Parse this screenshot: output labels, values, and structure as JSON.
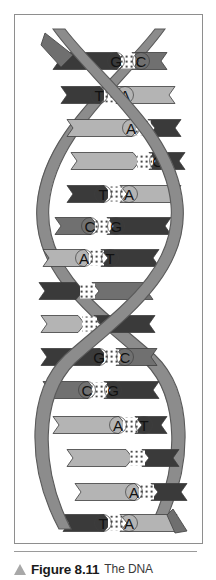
{
  "figure": {
    "panel_label": "dna-double-helix-diagram",
    "diagram_title": "DNA double helix with complementary base pairs",
    "colors": {
      "backbone": "#8c8c8c",
      "backbone_outline": "#5a5a5a",
      "base_dark": "#3a3a3a",
      "base_medium": "#707070",
      "base_light": "#b4b4b4",
      "panel_border": "#8e8e8e",
      "background": "#ffffff",
      "hydrogen_bond": "#ffffff",
      "caption_marker": "#a8a8a8"
    },
    "base_pairs": [
      {
        "id": "bp-1",
        "left": "G",
        "right": "C",
        "left_shade": "dark",
        "right_shade": "medium",
        "y": 46,
        "left_x": 38,
        "right_x": 152,
        "letter_left_x": 101,
        "letter_right_x": 126,
        "visible_left": true,
        "visible_right": true
      },
      {
        "id": "bp-2",
        "left": "T",
        "right": "A",
        "left_shade": "dark",
        "right_shade": "light",
        "y": 80,
        "left_x": 46,
        "right_x": 160,
        "letter_left_x": 84,
        "letter_right_x": 110,
        "visible_left": true,
        "visible_right": true
      },
      {
        "id": "bp-3",
        "left": "A",
        "right": "T",
        "left_shade": "light",
        "right_shade": "dark",
        "y": 113,
        "left_x": 52,
        "right_x": 166,
        "letter_left_x": 116,
        "letter_right_x": 142,
        "visible_left": true,
        "visible_right": false
      },
      {
        "id": "bp-4",
        "left": "C",
        "right": "G",
        "left_shade": "light",
        "right_shade": "dark",
        "y": 146,
        "left_x": 56,
        "right_x": 170,
        "letter_left_x": 117,
        "letter_right_x": 143,
        "visible_left": false,
        "visible_right": true
      },
      {
        "id": "bp-5",
        "left": "T",
        "right": "A",
        "left_shade": "dark",
        "right_shade": "light",
        "y": 179,
        "left_x": 52,
        "right_x": 166,
        "letter_left_x": 88,
        "letter_right_x": 114,
        "visible_left": true,
        "visible_right": true
      },
      {
        "id": "bp-6",
        "left": "C",
        "right": "G",
        "left_shade": "medium",
        "right_shade": "dark",
        "y": 211,
        "left_x": 40,
        "right_x": 156,
        "letter_left_x": 75,
        "letter_right_x": 101,
        "visible_left": true,
        "visible_right": true
      },
      {
        "id": "bp-7",
        "left": "A",
        "right": "T",
        "left_shade": "light",
        "right_shade": "dark",
        "y": 243,
        "left_x": 28,
        "right_x": 144,
        "letter_left_x": 69,
        "letter_right_x": 95,
        "visible_left": true,
        "visible_right": true
      },
      {
        "id": "bp-8",
        "left": "G",
        "right": "C",
        "left_shade": "dark",
        "right_shade": "medium",
        "y": 276,
        "left_x": 24,
        "right_x": 138,
        "letter_left_x": 60,
        "letter_right_x": 86,
        "visible_left": false,
        "visible_right": false
      },
      {
        "id": "bp-9",
        "left": "T",
        "right": "A",
        "left_shade": "light",
        "right_shade": "dark",
        "y": 309,
        "left_x": 26,
        "right_x": 140,
        "letter_left_x": 62,
        "letter_right_x": 88,
        "visible_left": false,
        "visible_right": false
      },
      {
        "id": "bp-10",
        "left": "G",
        "right": "C",
        "left_shade": "dark",
        "right_shade": "medium",
        "y": 342,
        "left_x": 26,
        "right_x": 142,
        "letter_left_x": 84,
        "letter_right_x": 110,
        "visible_left": true,
        "visible_right": true
      },
      {
        "id": "bp-11",
        "left": "C",
        "right": "G",
        "left_shade": "medium",
        "right_shade": "dark",
        "y": 375,
        "left_x": 28,
        "right_x": 144,
        "letter_left_x": 72,
        "letter_right_x": 98,
        "visible_left": true,
        "visible_right": true
      },
      {
        "id": "bp-12",
        "left": "A",
        "right": "T",
        "left_shade": "light",
        "right_shade": "dark",
        "y": 410,
        "left_x": 38,
        "right_x": 152,
        "letter_left_x": 103,
        "letter_right_x": 129,
        "visible_left": true,
        "visible_right": true
      },
      {
        "id": "bp-13",
        "left": "G",
        "right": "C",
        "left_shade": "light",
        "right_shade": "dark",
        "y": 443,
        "left_x": 52,
        "right_x": 164,
        "letter_left_x": 110,
        "letter_right_x": 136,
        "visible_left": false,
        "visible_right": false
      },
      {
        "id": "bp-14",
        "left": "A",
        "right": "T",
        "left_shade": "light",
        "right_shade": "dark",
        "y": 477,
        "left_x": 60,
        "right_x": 172,
        "letter_left_x": 119,
        "letter_right_x": 145,
        "visible_left": true,
        "visible_right": false
      },
      {
        "id": "bp-15",
        "left": "T",
        "right": "A",
        "left_shade": "dark",
        "right_shade": "light",
        "y": 508,
        "left_x": 48,
        "right_x": 162,
        "letter_left_x": 88,
        "letter_right_x": 114,
        "visible_left": true,
        "visible_right": true
      }
    ],
    "strands": [
      {
        "id": "strand-front",
        "name": "front-backbone-ribbon"
      },
      {
        "id": "strand-back",
        "name": "back-backbone-ribbon"
      }
    ]
  },
  "caption": {
    "marker": "triangle-up-icon",
    "figure_number": "Figure 8.11",
    "text": "The DNA"
  }
}
